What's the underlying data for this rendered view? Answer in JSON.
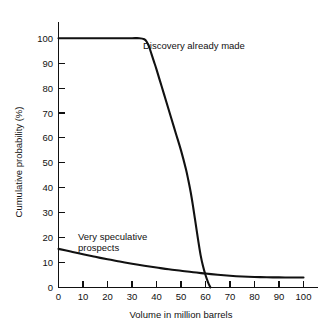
{
  "chart_data": {
    "type": "line",
    "title": "",
    "subtitle": "",
    "xlabel": "Volume in million barrels",
    "ylabel": "Cumulative probability (%)",
    "xlim": [
      0,
      100
    ],
    "ylim": [
      0,
      100
    ],
    "xticks": [
      0,
      10,
      20,
      30,
      40,
      50,
      60,
      70,
      80,
      90,
      100
    ],
    "yticks": [
      0,
      10,
      20,
      30,
      40,
      50,
      60,
      70,
      80,
      90,
      100
    ],
    "xtick_labels": [
      "0",
      "10",
      "20",
      "30",
      "40",
      "50",
      "60",
      "70",
      "80",
      "90",
      "100"
    ],
    "ytick_labels": [
      "0",
      "10",
      "20",
      "30",
      "40",
      "50",
      "60",
      "70",
      "80",
      "90",
      "100"
    ],
    "grid": false,
    "legend_position": "inline-annotation",
    "line_color": "#111111",
    "background_color": "#ffffff",
    "series": [
      {
        "name": "Discovery already made",
        "annotation_x": 47,
        "annotation_y": 96,
        "x": [
          0,
          5,
          10,
          15,
          20,
          25,
          30,
          33,
          35,
          36,
          37,
          38,
          39,
          40,
          42,
          44,
          46,
          48,
          50,
          52,
          53,
          54,
          55,
          56,
          57,
          58,
          59,
          60,
          61,
          62
        ],
        "values": [
          100,
          100,
          100,
          100,
          100,
          100,
          100,
          100,
          99.6,
          98.6,
          96.5,
          93.5,
          90.5,
          87.5,
          81,
          74.5,
          68,
          61.5,
          55,
          47.5,
          43,
          38,
          32,
          25.5,
          19,
          13,
          8.5,
          5,
          2.2,
          0
        ]
      },
      {
        "name": "Very speculative prospects",
        "annotation_x": 14,
        "annotation_y": 24,
        "x": [
          0,
          5,
          10,
          15,
          20,
          25,
          30,
          35,
          40,
          45,
          50,
          55,
          60,
          65,
          70,
          75,
          80,
          85,
          90,
          95,
          100
        ],
        "values": [
          15.5,
          14.4,
          13.3,
          12.3,
          11.3,
          10.4,
          9.5,
          8.7,
          8,
          7.3,
          6.7,
          6.1,
          5.6,
          5.1,
          4.7,
          4.4,
          4.2,
          4.1,
          4.05,
          4.0,
          4.0
        ]
      }
    ],
    "annotations": [
      {
        "id": "discovery",
        "text": "Discovery already made",
        "lines": [
          "Discovery already made"
        ]
      },
      {
        "id": "speculative",
        "text": "Very speculative prospects",
        "lines": [
          "Very speculative",
          "prospects"
        ]
      }
    ]
  }
}
